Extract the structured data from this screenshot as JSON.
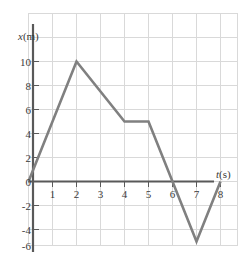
{
  "chart_data": {
    "type": "line",
    "title": "",
    "subtitle": "",
    "xlabel": "t(s)",
    "ylabel": "x(m)",
    "xlabel_italic_part": "t",
    "xlabel_rest": "(s)",
    "ylabel_italic_part": "x",
    "ylabel_rest": "(m)",
    "xlim": [
      -0.5,
      9.0
    ],
    "ylim": [
      -7.5,
      12.0
    ],
    "grid": true,
    "grid_color": "#d9d9d9",
    "legend": null,
    "legend_position": "none",
    "line_color": "#808080",
    "axis_color": "#595959",
    "background_color": "#ffffff",
    "x_ticks": [
      1,
      2,
      3,
      4,
      5,
      6,
      7,
      8
    ],
    "x_tick_labels": [
      "1",
      "2",
      "3",
      "4",
      "5",
      "6",
      "7",
      "8"
    ],
    "y_ticks": [
      10,
      8,
      6,
      4,
      2,
      0,
      -2,
      -4,
      -6
    ],
    "y_tick_labels": [
      "10",
      "8",
      "6",
      "4",
      "2",
      "0",
      "-2",
      "-4",
      "-6"
    ],
    "x_tick_step": 1,
    "y_tick_step": 2,
    "series": [
      {
        "name": "position",
        "x": [
          0,
          2,
          4,
          5,
          7,
          8
        ],
        "values": [
          0,
          10,
          5,
          5,
          -5,
          0
        ]
      }
    ],
    "points": [
      {
        "t": 0,
        "x": 0
      },
      {
        "t": 2,
        "x": 10
      },
      {
        "t": 4,
        "x": 5
      },
      {
        "t": 5,
        "x": 5
      },
      {
        "t": 7,
        "x": -5
      },
      {
        "t": 8,
        "x": 0
      }
    ],
    "zero_crossings": [
      0,
      6.25,
      8
    ],
    "annotations": []
  }
}
